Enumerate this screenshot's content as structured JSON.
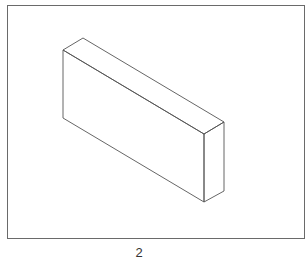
{
  "figure": {
    "caption": "2",
    "stroke_color": "#555555",
    "frame_color": "#6a6a6a",
    "shape": "isometric rectangular block",
    "vertices": {
      "front_top_left": [
        63,
        50
      ],
      "back_top_left": [
        83,
        38
      ],
      "back_top_right": [
        224,
        122
      ],
      "front_top_right": [
        204,
        134
      ],
      "front_bottom_left": [
        63,
        118
      ],
      "front_bottom_right": [
        204,
        202
      ],
      "back_bottom_right": [
        224,
        191
      ]
    }
  }
}
